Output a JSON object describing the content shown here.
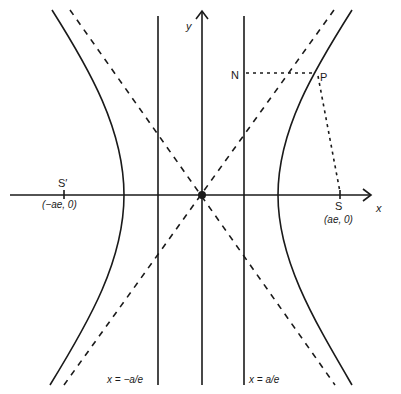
{
  "figure": {
    "type": "hyperbola-diagram",
    "colors": {
      "ink": "#1a1a1a",
      "background": "#ffffff"
    },
    "axes": {
      "x_label": "x",
      "y_label": "y",
      "origin_px": [
        202,
        195
      ]
    },
    "directrices": [
      {
        "label": "x = −a/e",
        "x_px": 158
      },
      {
        "label": "x = a/e",
        "x_px": 244
      }
    ],
    "foci": [
      {
        "name": "S′",
        "coord_label": "(−ae, 0)",
        "x_px": 64
      },
      {
        "name": "S",
        "coord_label": "(ae, 0)",
        "x_px": 340
      }
    ],
    "points": {
      "P": {
        "label": "P",
        "px": [
          316,
          73
        ]
      },
      "N": {
        "label": "N",
        "px": [
          244,
          73
        ]
      }
    },
    "hyperbola": {
      "a_px": 77,
      "b_px": 94
    },
    "asymptotes": {
      "style": "dashed"
    },
    "construction_lines": [
      {
        "from": "N",
        "to": "P",
        "style": "dotted"
      },
      {
        "from": "P",
        "to": "S",
        "style": "dotted"
      }
    ]
  }
}
